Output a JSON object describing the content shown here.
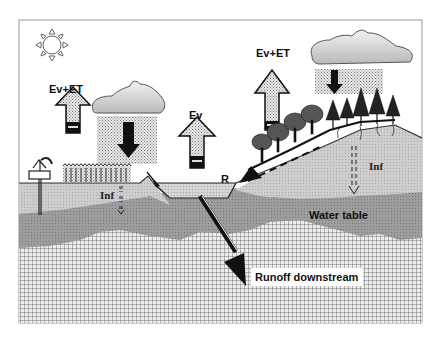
{
  "diagram": {
    "type": "hydrological-cycle-landscape",
    "labels": {
      "evet_left": "Ev+ET",
      "ev_center": "Ev",
      "evet_right": "Ev+ET",
      "runoff_r": "R",
      "inf_left": "Inf",
      "inf_right": "Inf",
      "water_table": "Water table",
      "runoff_downstream": "Runoff downstream"
    },
    "elements": [
      {
        "name": "sun-icon",
        "description": "sun outline top-left"
      },
      {
        "name": "cloud-left",
        "description": "gray cloud with stippled rain and down arrow over cropland"
      },
      {
        "name": "cloud-right",
        "description": "gray cloud with stippled rain and down arrow over forest"
      },
      {
        "name": "evaporation-transpiration-arrow-left",
        "description": "up arrow over cropland"
      },
      {
        "name": "evaporation-arrow-center",
        "description": "up arrow over pond"
      },
      {
        "name": "evaporation-transpiration-arrow-right",
        "description": "up arrow over hillside trees"
      },
      {
        "name": "well-pump",
        "description": "hand pump on left"
      },
      {
        "name": "crops",
        "description": "row of crops on flat field"
      },
      {
        "name": "pond",
        "description": "water body in depression"
      },
      {
        "name": "trees",
        "description": "deciduous and conifer trees on hillside"
      },
      {
        "name": "runoff-arrow",
        "description": "dashed arrow down slope to pond"
      },
      {
        "name": "downstream-arrow",
        "description": "thick diagonal black arrow into groundwater"
      }
    ],
    "colors": {
      "soil": "#c8c8c8",
      "saturated_zone": "#9a9a9a",
      "bedrock_grid": "#7a7a7a",
      "cloud": "#cfcfcf",
      "arrow_fill": "#e4e4e4",
      "dark": "#111111"
    }
  }
}
